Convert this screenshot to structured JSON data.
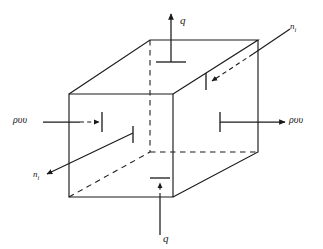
{
  "figure": {
    "line_color": "#1a1a1a",
    "background_color": "#ffffff"
  },
  "labels": {
    "q_top": "q",
    "q_bottom": "q",
    "flux_left": "ρυυ",
    "flux_right": "ρυυ",
    "normal_upper_right": "n",
    "normal_upper_right_sub": "i",
    "normal_lower_left": "n",
    "normal_lower_left_sub": "i"
  },
  "geometry": {
    "front_face": {
      "top_left": [
        69,
        94
      ],
      "top_right": [
        173,
        94
      ],
      "bottom_right": [
        173,
        197
      ],
      "bottom_left": [
        69,
        197
      ]
    },
    "back_face": {
      "top_left": [
        150,
        40
      ],
      "top_right": [
        258,
        40
      ],
      "bottom_right": [
        258,
        152
      ],
      "bottom_left": [
        150,
        152
      ]
    },
    "hidden_edges": [
      "back_top_left-to-back_bottom_left",
      "back_bottom_left-to-back_bottom_right",
      "front_bottom_left-to-back_bottom_left"
    ]
  },
  "arrows": {
    "q_top": {
      "direction": "up",
      "tail": [
        171,
        62
      ],
      "head": [
        171,
        13
      ],
      "tick": "horizontal-bar-at-tail"
    },
    "q_bottom": {
      "direction": "up",
      "tail": [
        160,
        235
      ],
      "head": [
        160,
        182
      ],
      "dashed_segment": true,
      "tick": "horizontal-bar-at-head"
    },
    "flux_left": {
      "direction": "right",
      "tail": [
        43,
        122
      ],
      "head": [
        99,
        122
      ],
      "dashed_segment": true,
      "tick": "vertical-bar-at-head"
    },
    "flux_right": {
      "direction": "right",
      "tail": [
        220,
        122
      ],
      "head": [
        285,
        122
      ],
      "tick": "vertical-bar-at-tail"
    },
    "normal_upper_right": {
      "direction": "down-left",
      "tail": [
        288,
        30
      ],
      "head": [
        210,
        82
      ],
      "dashed_segment": true,
      "tick": "vertical-bar-at-head"
    },
    "normal_lower_left": {
      "direction": "down-left",
      "tail": [
        133,
        133
      ],
      "head": [
        45,
        175
      ],
      "tick": "vertical-bar-at-tail"
    }
  }
}
